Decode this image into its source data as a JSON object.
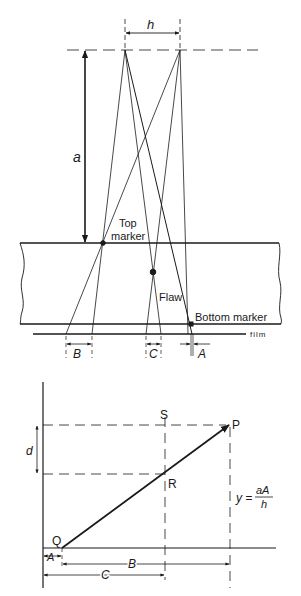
{
  "figure": {
    "top_diagram": {
      "labels": {
        "h": "h",
        "a": "a",
        "top_marker_line1": "Top",
        "top_marker_line2": "marker",
        "flaw": "Flaw",
        "bottom_marker": "Bottom marker",
        "film": "film",
        "B": "B",
        "C": "C",
        "A": "A"
      }
    },
    "bottom_diagram": {
      "labels": {
        "S": "S",
        "P": "P",
        "R": "R",
        "Q": "Q",
        "d": "d",
        "y_eq": "y =",
        "frac_num": "aA",
        "frac_den": "h",
        "A": "A",
        "B": "B",
        "C": "C"
      }
    },
    "colors": {
      "ink": "#1a1a1a",
      "background": "#ffffff"
    }
  }
}
